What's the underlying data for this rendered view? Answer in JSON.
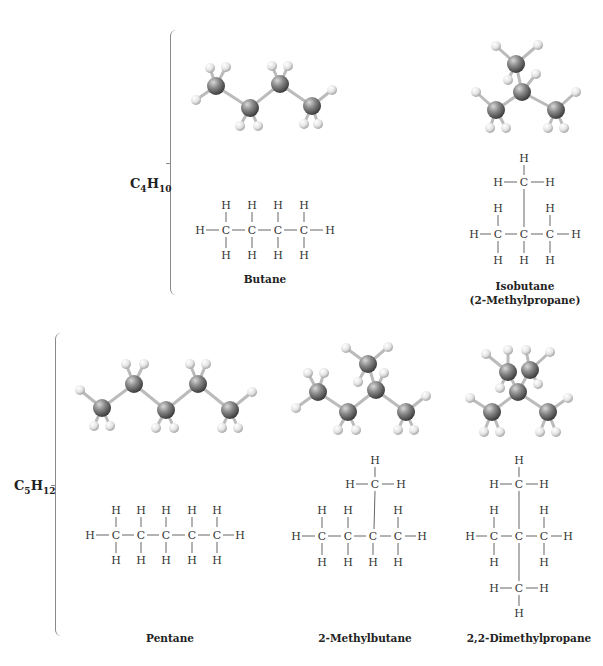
{
  "figure": {
    "groups": [
      {
        "formula": {
          "element1": "C",
          "sub1": "4",
          "element2": "H",
          "sub2": "10"
        },
        "molecules": [
          {
            "name": "Butane",
            "subtitle": ""
          },
          {
            "name": "Isobutane",
            "subtitle": "(2-Methylpropane)"
          }
        ]
      },
      {
        "formula": {
          "element1": "C",
          "sub1": "5",
          "element2": "H",
          "sub2": "12"
        },
        "molecules": [
          {
            "name": "Pentane",
            "subtitle": ""
          },
          {
            "name": "2-Methylbutane",
            "subtitle": ""
          },
          {
            "name": "2,2-Dimethylpropane",
            "subtitle": ""
          }
        ]
      }
    ],
    "atom_labels": {
      "carbon": "C",
      "hydrogen": "H"
    },
    "colors": {
      "carbon": "#7a7a7a",
      "hydrogen": "#e8e8e8",
      "bond": "#555555",
      "brace": "#8a8a8a"
    }
  }
}
